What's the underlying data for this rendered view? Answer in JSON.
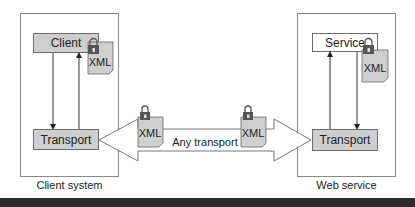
{
  "diagram": {
    "left_system": {
      "caption": "Client system",
      "top_node": "Client",
      "bottom_node": "Transport",
      "doc_label": "XML"
    },
    "right_system": {
      "caption": "Web service",
      "top_node": "Service",
      "bottom_node": "Transport",
      "doc_label": "XML"
    },
    "channel": {
      "label": "Any transport",
      "doc_left_label": "XML",
      "doc_right_label": "XML"
    },
    "colors": {
      "node_fill": "#cfcfcf",
      "border": "#6d6d6d",
      "bottom_bar": "#2a2a2a"
    }
  }
}
